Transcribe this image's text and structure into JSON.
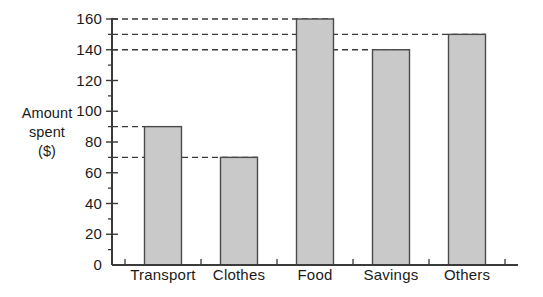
{
  "chart_data": {
    "type": "bar",
    "title": "",
    "xlabel": "",
    "ylabel": "Amount spent ($)",
    "ylabel_lines": [
      "Amount",
      "spent",
      "($)"
    ],
    "categories": [
      "Transport",
      "Clothes",
      "Food",
      "Savings",
      "Others"
    ],
    "values": [
      90,
      70,
      160,
      140,
      150
    ],
    "ylim": [
      0,
      160
    ],
    "ytick_labels": [
      "0",
      "20",
      "40",
      "60",
      "80",
      "100",
      "120",
      "140",
      "160"
    ],
    "ytick_values": [
      0,
      20,
      40,
      60,
      80,
      100,
      120,
      140,
      160
    ],
    "yminor_values": [
      10,
      30,
      50,
      70,
      90,
      110,
      130,
      150
    ],
    "ytick_step": 20,
    "grid": false,
    "legend": false,
    "annotations": [
      {
        "label": "160",
        "value": 160,
        "style": "dashed-leader",
        "to_category": "Food"
      },
      {
        "label": "150",
        "value": 150,
        "style": "dashed-leader",
        "to_category": "Others"
      },
      {
        "label": "140",
        "value": 140,
        "style": "dashed-leader",
        "to_category": "Savings"
      },
      {
        "label": "90",
        "value": 90,
        "style": "dashed-leader",
        "to_category": "Transport"
      },
      {
        "label": "70",
        "value": 70,
        "style": "dashed-leader",
        "to_category": "Clothes"
      }
    ],
    "colors": {
      "bar_fill": "#c9c9c9",
      "bar_stroke": "#4a4a4a",
      "axis": "#3a3a3a",
      "dashed_line": "#3a3a3a",
      "background": "#ffffff",
      "text": "#1a1a1a"
    }
  }
}
